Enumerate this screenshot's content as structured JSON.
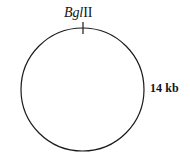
{
  "figure": {
    "type": "circular-plasmid-map",
    "background_color": "#ffffff",
    "stroke_color": "#1a1a1a"
  },
  "diagram": {
    "circle": {
      "center_x": 82.5,
      "center_y": 89.5,
      "radius": 61.5,
      "stroke_width": 1.2
    },
    "restriction_sites": [
      {
        "name_italic": "Bgl",
        "name_roman": "II",
        "angle_deg": 0,
        "tick": {
          "x": 83,
          "y_start": 22,
          "y_end": 34,
          "stroke_width": 1.2
        }
      }
    ]
  },
  "labels": {
    "site": {
      "italic_part": "Bgl",
      "roman_part": "II",
      "full_text": "BglII"
    },
    "size": {
      "text": "14 kb",
      "value": 14,
      "unit": "kb"
    }
  }
}
